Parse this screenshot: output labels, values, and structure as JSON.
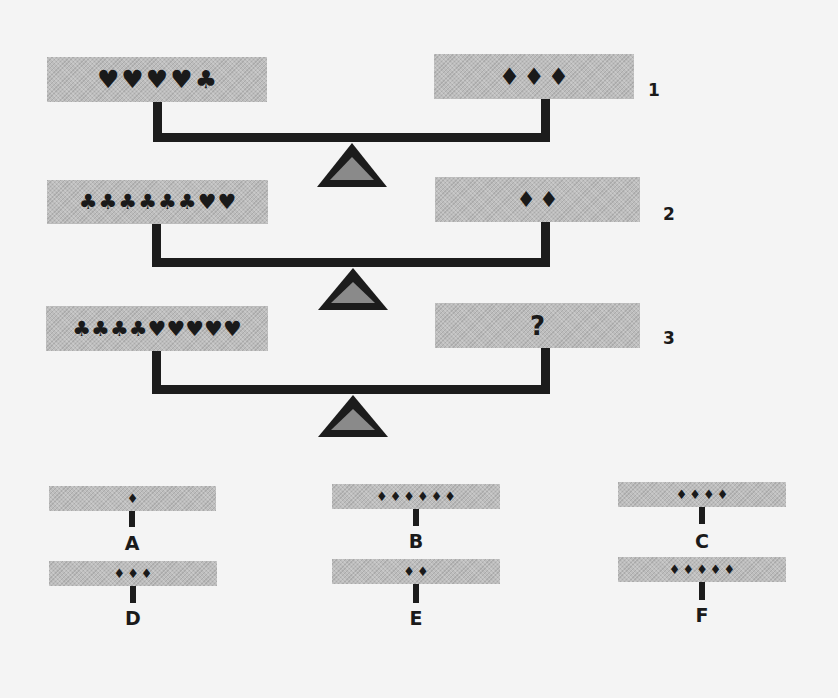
{
  "puzzle": {
    "scales": [
      {
        "number": "1",
        "left": [
          "♥",
          "♥",
          "♥",
          "♥",
          "♣"
        ],
        "right": [
          "♦",
          "♦",
          "♦"
        ]
      },
      {
        "number": "2",
        "left": [
          "♣",
          "♣",
          "♣",
          "♣",
          "♣",
          "♣",
          "♥",
          "♥"
        ],
        "right": [
          "♦",
          "♦"
        ]
      },
      {
        "number": "3",
        "left": [
          "♣",
          "♣",
          "♣",
          "♣",
          "♥",
          "♥",
          "♥",
          "♥",
          "♥"
        ],
        "right_unknown": "?"
      }
    ],
    "options": [
      {
        "label": "A",
        "count": 1
      },
      {
        "label": "B",
        "count": 6
      },
      {
        "label": "C",
        "count": 4
      },
      {
        "label": "D",
        "count": 3
      },
      {
        "label": "E",
        "count": 2
      },
      {
        "label": "F",
        "count": 5
      }
    ],
    "symbols": {
      "heart": "♥",
      "club": "♣",
      "diamond": "♦"
    },
    "colors": {
      "background": "#f4f4f4",
      "panel": "#bdbdbd",
      "ink": "#1c1c1c",
      "fulcrum_fill": "#8a8a8a"
    }
  }
}
